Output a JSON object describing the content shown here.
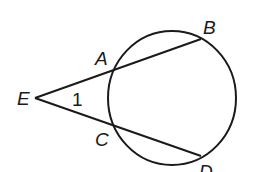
{
  "diagram": {
    "type": "secant-secant angle",
    "labels": {
      "E": "E",
      "A": "A",
      "B": "B",
      "C": "C",
      "D": "D",
      "angle": "1"
    },
    "colors": {
      "stroke": "#1a1a1a",
      "background": "#ffffff"
    }
  }
}
